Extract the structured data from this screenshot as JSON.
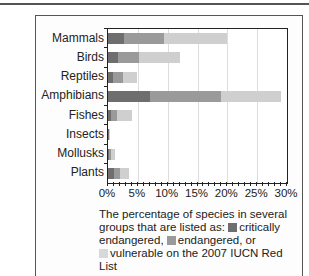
{
  "chart_data": {
    "type": "bar",
    "orientation": "horizontal",
    "stacked": true,
    "categories": [
      "Mammals",
      "Birds",
      "Reptiles",
      "Amphibians",
      "Fishes",
      "Insects",
      "Mollusks",
      "Plants"
    ],
    "series": [
      {
        "name": "critically endangered",
        "color": "#6e6e6e",
        "values": [
          2.7,
          1.7,
          0.9,
          7.0,
          0.5,
          0.1,
          0.2,
          1.0
        ]
      },
      {
        "name": "endangered",
        "color": "#9a9a9a",
        "values": [
          6.7,
          3.5,
          1.6,
          12.0,
          1.0,
          0.1,
          0.3,
          1.0
        ]
      },
      {
        "name": "vulnerable",
        "color": "#cfcfcf",
        "values": [
          10.6,
          6.8,
          2.4,
          10.0,
          2.5,
          0.1,
          0.7,
          1.5
        ]
      }
    ],
    "x_ticks": [
      "0%",
      "5%",
      "10%",
      "15%",
      "20%",
      "25%",
      "30%"
    ],
    "xlim": [
      0,
      30
    ],
    "grid": true,
    "caption": "The percentage of species in several groups that are listed as: critically endangered, endangered, or vulnerable on the 2007 IUCN Red List"
  },
  "caption": {
    "part1": "The percentage of species in several groups that are listed as: ",
    "crit": "critically endangered, ",
    "end": "endangered, or",
    "vul": "vulnerable on the 2007 IUCN Red List"
  }
}
